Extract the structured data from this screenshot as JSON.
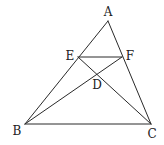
{
  "diagram": {
    "type": "geometry",
    "points": {
      "A": {
        "x": 108,
        "y": 21,
        "label": "A",
        "lx": 108,
        "ly": 12
      },
      "B": {
        "x": 25,
        "y": 124,
        "label": "B",
        "lx": 17,
        "ly": 131
      },
      "C": {
        "x": 151,
        "y": 124,
        "label": "C",
        "lx": 152,
        "ly": 134
      },
      "D": {
        "x": 97,
        "y": 74,
        "label": "D",
        "lx": 97,
        "ly": 85
      },
      "E": {
        "x": 78,
        "y": 57,
        "label": "E",
        "lx": 70,
        "ly": 56
      },
      "F": {
        "x": 122,
        "y": 57,
        "label": "F",
        "lx": 130,
        "ly": 56
      }
    },
    "segments": [
      [
        "A",
        "B"
      ],
      [
        "A",
        "C"
      ],
      [
        "B",
        "C"
      ],
      [
        "E",
        "F"
      ],
      [
        "B",
        "F"
      ],
      [
        "E",
        "C"
      ]
    ],
    "stroke_color": "#2a2a2a",
    "background": "#ffffff"
  }
}
